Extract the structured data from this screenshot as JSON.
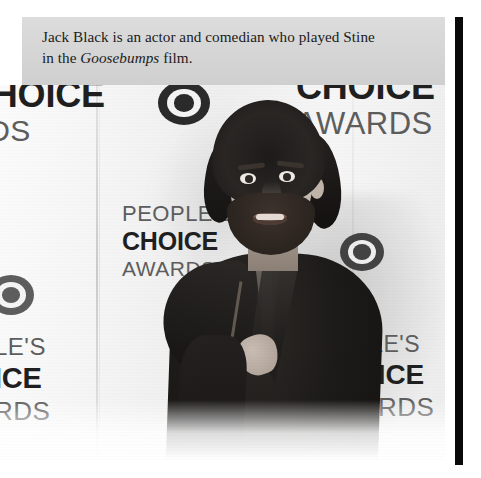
{
  "figure": {
    "caption": {
      "line1_before_italic": "Jack Black is an actor and comedian who played Stine",
      "line2_prefix": "in the ",
      "line2_italic": "Goosebumps",
      "line2_suffix": " film."
    },
    "photo": {
      "alt": "Jack Black posing in a dark suit in front of a People's Choice Awards step-and-repeat backdrop",
      "subject_name": "Jack Black",
      "color_mode": "black-and-white",
      "backdrop": {
        "event_brand": "People's Choice Awards",
        "lockups": [
          {
            "id": "lockup-top-left",
            "people": "",
            "choice": "CHOICE",
            "awards": "RDS",
            "note": "cropped at left page edge"
          },
          {
            "id": "lockup-top-right",
            "people": "",
            "choice": "CHOICE",
            "awards": "AWARDS"
          },
          {
            "id": "lockup-middle",
            "people": "PEOPLE'S",
            "choice": "CHOICE",
            "awards": "AWARDS"
          },
          {
            "id": "lockup-bottom-left",
            "people": "LE'S",
            "choice": "ICE",
            "awards": "RDS",
            "note": "cropped at left page edge"
          },
          {
            "id": "lockup-bottom-right",
            "people": "OPLE'S",
            "choice": "HOICE",
            "awards": "WARDS"
          }
        ],
        "sponsor_logo": "cbs-eye-logo",
        "sponsor_logo_count": 3
      }
    },
    "scan_artifact": {
      "name": "black-page-edge-bar",
      "color": "#0a0a0a"
    },
    "colors": {
      "page_background": "#ffffff",
      "caption_background": "#d6d6d6",
      "caption_text": "#1b1b1b",
      "backdrop_white": "#f4f4f4",
      "logo_dark": "#1f1f1f",
      "logo_gray": "#5d5d5d",
      "suit_black": "#1a1817"
    }
  }
}
